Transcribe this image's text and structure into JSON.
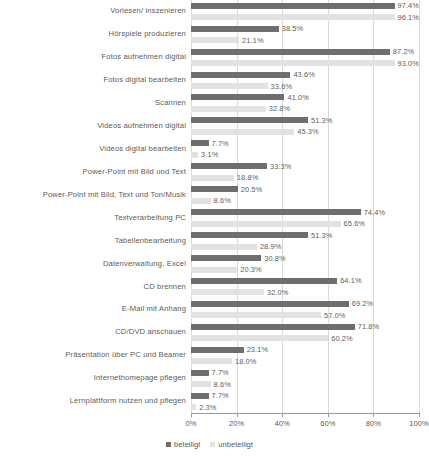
{
  "chart_data": {
    "type": "bar",
    "orientation": "horizontal",
    "title": "",
    "subtitle": "",
    "xlabel": "",
    "ylabel": "",
    "xlim": [
      0,
      100
    ],
    "xticks": [
      "0%",
      "20%",
      "40%",
      "60%",
      "80%",
      "100%"
    ],
    "xtick_values": [
      0,
      20,
      40,
      60,
      80,
      100
    ],
    "grid": true,
    "legend_position": "bottom",
    "value_suffix": "%",
    "categories": [
      "Vorlesen/ inszenieren",
      "Hörspiele produzieren",
      "Fotos aufnehmen digital",
      "Fotos digital bearbeiten",
      "Scannen",
      "Videos aufnehmen digital",
      "Videos digital bearbeiten",
      "Power-Point mit Bild und Text",
      "Power-Point mit Bild, Text und Ton/Musik",
      "Textverarbeitung PC",
      "Tabellenbearbeitung",
      "Datenverwaltung, Excel",
      "CD brennen",
      "E-Mail mit Anhang",
      "CD/DVD anschauen",
      "Präsentation über PC und Beamer",
      "Internethomepage pflegen",
      "Lernplattform nutzen und pflegen"
    ],
    "series": [
      {
        "name": "beteiligt",
        "color": "#6e6e6e",
        "values": [
          97.4,
          38.5,
          87.2,
          43.6,
          41.0,
          51.3,
          7.7,
          33.3,
          20.5,
          74.4,
          51.3,
          30.8,
          64.1,
          69.2,
          71.8,
          23.1,
          7.7,
          7.7
        ],
        "labels": [
          "97.4%",
          "38.5%",
          "87.2%",
          "43.6%",
          "41.0%",
          "51.3%",
          "7.7%",
          "33.3%",
          "20.5%",
          "74.4%",
          "51.3%",
          "30.8%",
          "64.1%",
          "69.2%",
          "71.8%",
          "23.1%",
          "7.7%",
          "7.7%"
        ]
      },
      {
        "name": "unbeteiligt",
        "color": "#e2e2e2",
        "values": [
          96.1,
          21.1,
          93.0,
          33.6,
          32.8,
          45.3,
          3.1,
          18.8,
          8.6,
          65.6,
          28.9,
          20.3,
          32.0,
          57.0,
          60.2,
          18.0,
          8.6,
          2.3
        ],
        "labels": [
          "96.1%",
          "21.1%",
          "93.0%",
          "33.6%",
          "32.8%",
          "45.3%",
          "3.1%",
          "18.8%",
          "8.6%",
          "65.6%",
          "28.9%",
          "20.3%",
          "32.0%",
          "57.0%",
          "60.2%",
          "18.0%",
          "8.6%",
          "2.3%"
        ]
      }
    ]
  },
  "legend": {
    "items": [
      {
        "label": "beteiligt"
      },
      {
        "label": "unbeteiligt"
      }
    ]
  },
  "colors": {
    "beteiligt": "#6e6e6e",
    "unbeteiligt": "#e2e2e2",
    "gridline": "#d9d9d9",
    "axis": "#9a9a9a",
    "text": "#5b5b5b"
  }
}
